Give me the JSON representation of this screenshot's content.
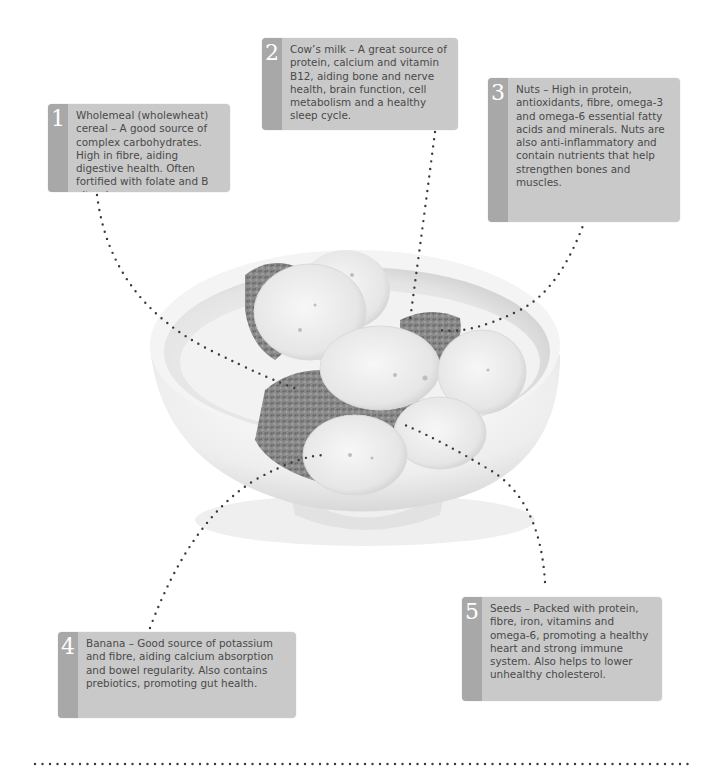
{
  "diagram": {
    "colors": {
      "callout_bg": "#c9c9c9",
      "number_tab_bg": "#a8a8a8",
      "number_text": "#ffffff",
      "body_text": "#4a4a4a",
      "dotted_line": "#3a3a3a"
    },
    "callouts": [
      {
        "number": "1",
        "text": "Wholemeal (wholewheat) cereal – A good source of complex carbohydrates. High in fibre, aiding digestive health. Often fortified with folate and B vitamins."
      },
      {
        "number": "2",
        "text": "Cow’s milk – A great source of protein, calcium and vitamin B12, aiding bone and nerve health, brain function, cell metabolism and a healthy sleep cycle."
      },
      {
        "number": "3",
        "text": "Nuts – High in protein, antioxidants, fibre, omega-3 and omega-6 essential fatty acids and minerals. Nuts are also anti-inflammatory and contain nutrients that help strengthen bones and muscles."
      },
      {
        "number": "4",
        "text": "Banana – Good source of potassium and fibre, aiding calcium absorption and bowel regularity. Also contains prebiotics, promoting gut health."
      },
      {
        "number": "5",
        "text": "Seeds – Packed with protein, fibre, iron, vitamins and omega-6, promoting a healthy heart and strong immune system. Also helps to lower unhealthy cholesterol."
      }
    ]
  }
}
